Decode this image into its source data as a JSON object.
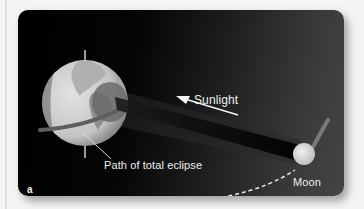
{
  "figure": {
    "panel_label": "a",
    "labels": {
      "sunlight": "Sunlight",
      "path": "Path of total eclipse",
      "moon": "Moon"
    },
    "colors": {
      "background": "#f4f4f4",
      "panel_dark": "#000000",
      "panel_light": "#444444",
      "earth_light": "#d6d6d6",
      "earth_land": "#9a9a9a",
      "shadow_umbra": "#5a5a5a",
      "moon": "#d8d8d8",
      "text": "#f0f0f0"
    },
    "elements": [
      "earth",
      "moon",
      "moon-shadow-cone",
      "sunlight-arrow",
      "eclipse-path",
      "moon-orbit-dashed",
      "moon-motion-arrow"
    ]
  }
}
